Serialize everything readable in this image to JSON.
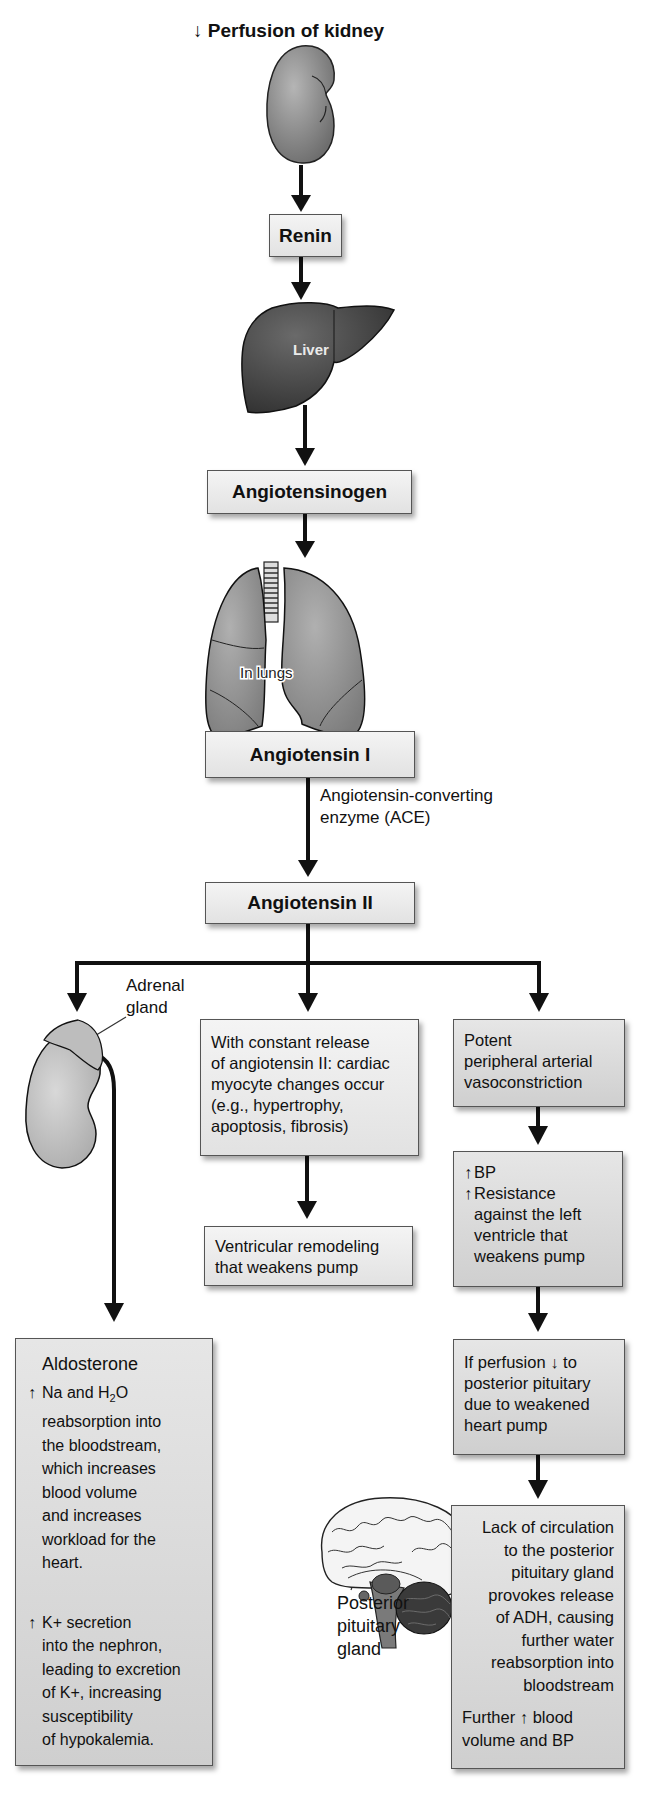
{
  "diagram": {
    "title_arrow": "↓",
    "title": "Perfusion of kidney",
    "nodes": {
      "renin": "Renin",
      "liver_label": "Liver",
      "angiotensinogen": "Angiotensinogen",
      "lungs_label": "In lungs",
      "angiotensin_1": "Angiotensin I",
      "ace_label_line1": "Angiotensin-converting",
      "ace_label_line2": "enzyme (ACE)",
      "angiotensin_2": "Angiotensin II",
      "adrenal_label_line1": "Adrenal",
      "adrenal_label_line2": "gland"
    },
    "middle_branch": {
      "cardiac_box": [
        "With constant release",
        "of angiotensin II: cardiac",
        "myocyte changes occur",
        "(e.g., hypertrophy,",
        "apoptosis, fibrosis)"
      ],
      "remodeling_box": [
        "Ventricular remodeling",
        "that weakens pump"
      ]
    },
    "right_branch": {
      "vasoconstriction_box": [
        "Potent",
        "peripheral arterial",
        "vasoconstriction"
      ],
      "bp_box": {
        "up_arrow": "↑",
        "line1": "BP",
        "line2": "Resistance",
        "rest": [
          "against the left",
          "ventricle that",
          "weakens pump"
        ]
      },
      "perfusion_box": {
        "line1_a": "If perfusion",
        "down_arrow": "↓",
        "line1_b": "to",
        "rest": [
          "posterior pituitary",
          "due to weakened",
          "heart pump"
        ]
      },
      "adh_box": {
        "lines": [
          "Lack of circulation",
          "to the posterior",
          "pituitary gland",
          "provokes release",
          "of ADH, causing",
          "further water",
          "reabsorption into",
          "bloodstream"
        ],
        "further_a": "Further",
        "up_arrow": "↑",
        "further_b": "blood",
        "further_c": "volume and BP"
      },
      "pituitary_label": [
        "Posterior",
        "pituitary",
        "gland"
      ]
    },
    "left_branch": {
      "aldosterone_box": {
        "heading": "Aldosterone",
        "up_arrow": "↑",
        "na_a": "Na and H",
        "na_sub": "2",
        "na_b": "O",
        "na_rest": [
          "reabsorption into",
          "the bloodstream,",
          "which increases",
          "blood volume",
          "and increases",
          "workload for the",
          "heart."
        ],
        "k_line1": "K+ secretion",
        "k_rest": [
          "into the nephron,",
          "leading to excretion",
          "of K+, increasing",
          "susceptibility",
          "of hypokalemia."
        ]
      }
    },
    "colors": {
      "arrow": "#111111",
      "box_border": "#555555",
      "box_fill": "#e8e8e8",
      "organ_dark": "#4a4a4a",
      "organ_mid": "#8c8c8c",
      "organ_light": "#b8b8b8"
    }
  }
}
